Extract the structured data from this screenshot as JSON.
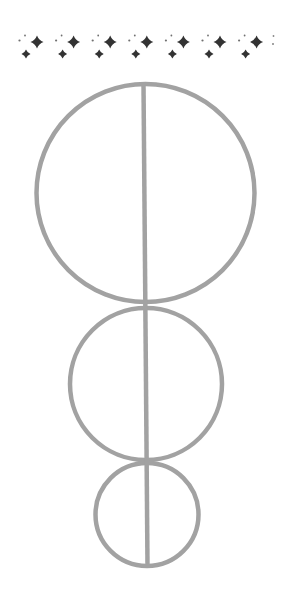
{
  "colors": {
    "background": "#ffffff",
    "stroke": "#a2a2a2",
    "sparkle": "#333333"
  },
  "sparkle_border": {
    "icon": "sparkle-icon",
    "y_big": 42,
    "y_small": 54,
    "group_offsets": [
      0,
      36.6,
      73.2,
      109.8,
      146.4,
      183,
      219.6
    ],
    "base": {
      "big_star": {
        "x": 37,
        "y": 42,
        "r": 6.5
      },
      "small_star": {
        "x": 26,
        "y": 54,
        "r": 4.5
      },
      "dots": [
        {
          "x": 19.5,
          "y": 40.5,
          "r": 1.1
        },
        {
          "x": 25,
          "y": 35.5,
          "r": 0.9
        }
      ]
    },
    "trailing_dots": [
      {
        "x": 273.5,
        "y": 36,
        "r": 0.9
      },
      {
        "x": 273,
        "y": 44,
        "r": 1.0
      }
    ]
  },
  "figure": {
    "stroke_width": 4.5,
    "circles": [
      {
        "name": "large-circle",
        "cx": 145.5,
        "cy": 193,
        "r": 109
      },
      {
        "name": "medium-circle",
        "cx": 146,
        "cy": 384,
        "r": 76
      },
      {
        "name": "small-circle",
        "cx": 147,
        "cy": 514.5,
        "r": 51.5
      }
    ],
    "axis_line": {
      "x1": 143.5,
      "y1": 84,
      "x2": 147.5,
      "y2": 566
    }
  }
}
